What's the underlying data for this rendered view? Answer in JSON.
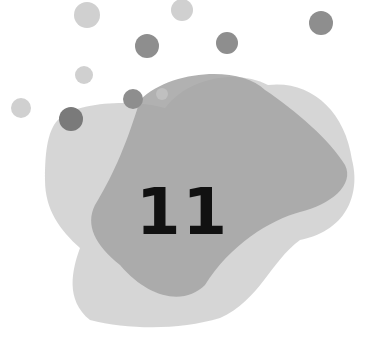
{
  "graphic": {
    "number": "11",
    "colors": {
      "background": "#ffffff",
      "blob_light": "#d4d4d4",
      "blob_mid": "#c4c4c4",
      "blob_dark": "#a3a3a3",
      "dot_light": "#d0d0d0",
      "dot_dark": "#8e8e8e",
      "text": "#111111"
    }
  }
}
